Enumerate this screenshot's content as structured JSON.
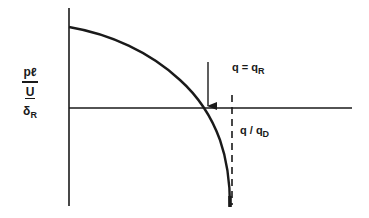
{
  "diagram": {
    "y_label": {
      "numerator": "pℓ",
      "middle": "U",
      "denominator_main": "δ",
      "denominator_sub": "R"
    },
    "annotations": {
      "arrow_label_main": "q = q",
      "arrow_label_sub": "R",
      "dashed_label_main": "q / q",
      "dashed_label_sub": "D"
    },
    "elements": {
      "y_axis": "vertical axis",
      "x_axis": "horizontal reference line at zero",
      "curve": "decreasing curve crossing zero at q = q_R and asymptotic to q/q_D",
      "arrow": "downward arrow marking q = q_R crossing",
      "dashed_line": "vertical dashed asymptote at q/q_D"
    },
    "colors": {
      "ink": "#1a1a1a",
      "background": "#ffffff"
    }
  }
}
